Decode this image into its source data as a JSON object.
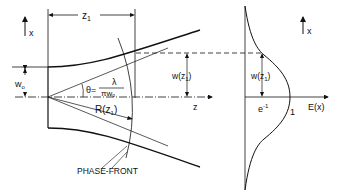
{
  "diagram": {
    "left": {
      "axis_x_label": "x",
      "axis_z_label": "z",
      "z1_label": "z",
      "z1_sub": "1",
      "w0_label": "w",
      "w0_sub": "o",
      "theta_label": "θ=",
      "theta_num": "λ",
      "theta_den": "πw",
      "theta_den_sub": "o",
      "radius_label": "R(z",
      "radius_sub": "1",
      "radius_close": ")",
      "width_label": "w(z",
      "width_sub": "1",
      "width_close": ")",
      "phase_front_label": "PHASE-FRONT"
    },
    "right": {
      "axis_x_label": "x",
      "axis_E_label": "E(x)",
      "e_inv_label": "e",
      "e_inv_sup": "-1",
      "one_label": "1",
      "width_label": "w(z",
      "width_sub": "1",
      "width_close": ")"
    }
  }
}
